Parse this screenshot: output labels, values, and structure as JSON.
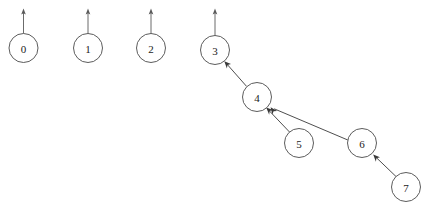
{
  "diagram": {
    "type": "directed-graph",
    "canvas": {
      "width": 427,
      "height": 207,
      "background": "#ffffff"
    },
    "style": {
      "node_radius": 14.5,
      "node_fill": "#ffffff",
      "node_stroke": "#4a4a4a",
      "edge_color": "#3a3a3a",
      "root_arrow_color": "#5a5a5a",
      "label_color": "#1a1a1a"
    },
    "nodes": [
      {
        "id": "0",
        "label": "0",
        "cx": 23.5,
        "cy": 48,
        "r": 14.5
      },
      {
        "id": "1",
        "label": "1",
        "cx": 88,
        "cy": 48,
        "r": 14.5
      },
      {
        "id": "2",
        "label": "2",
        "cx": 151,
        "cy": 48,
        "r": 14.5
      },
      {
        "id": "3",
        "label": "3",
        "cx": 215,
        "cy": 50,
        "r": 14.5
      },
      {
        "id": "4",
        "label": "4",
        "cx": 257,
        "cy": 97,
        "r": 14.5
      },
      {
        "id": "5",
        "label": "5",
        "cx": 299,
        "cy": 143,
        "r": 14.5
      },
      {
        "id": "6",
        "label": "6",
        "cx": 362,
        "cy": 143,
        "r": 14.5
      },
      {
        "id": "7",
        "label": "7",
        "cx": 406,
        "cy": 187,
        "r": 14.5
      }
    ],
    "edges": [
      {
        "id": "edge-4-3",
        "from": "4",
        "to": "3",
        "x1": 246.6,
        "y1": 86.4,
        "x2": 225.0,
        "y2": 62.0
      },
      {
        "id": "edge-5-4",
        "from": "5",
        "to": "4",
        "x1": 289.5,
        "y1": 132.0,
        "x2": 266.7,
        "y2": 108.0
      },
      {
        "id": "edge-6-4",
        "from": "6",
        "to": "4",
        "x1": 347.8,
        "y1": 140.0,
        "x2": 271.3,
        "y2": 107.5
      },
      {
        "id": "edge-7-6",
        "from": "7",
        "to": "6",
        "x1": 396.0,
        "y1": 176.5,
        "x2": 373.5,
        "y2": 155.0
      }
    ],
    "root_arrows": [
      {
        "id": "root-arrow-0",
        "node": "0",
        "x": 23.5,
        "y_bottom": 33.5,
        "y_top": 9
      },
      {
        "id": "root-arrow-1",
        "node": "1",
        "x": 88,
        "y_bottom": 33.5,
        "y_top": 9
      },
      {
        "id": "root-arrow-2",
        "node": "2",
        "x": 151,
        "y_bottom": 33.5,
        "y_top": 9
      },
      {
        "id": "root-arrow-3",
        "node": "3",
        "x": 215,
        "y_bottom": 35.5,
        "y_top": 9
      }
    ]
  }
}
